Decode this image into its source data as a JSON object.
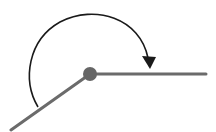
{
  "diagram": {
    "type": "angle",
    "colors": {
      "background": "#ffffff",
      "ray": "#6b6b6b",
      "vertex": "#666666",
      "arc": "#1a1a1a"
    },
    "vertex": {
      "x": 90,
      "y": 74,
      "r": 7
    },
    "rays": [
      {
        "name": "horizontal-ray",
        "x2": 206,
        "y2": 74
      },
      {
        "name": "lower-left-ray",
        "x2": 11,
        "y2": 130
      }
    ],
    "arc": {
      "start": {
        "x": 38,
        "y": 107
      },
      "end": {
        "x": 149,
        "y": 66
      },
      "direction": "clockwise"
    }
  }
}
